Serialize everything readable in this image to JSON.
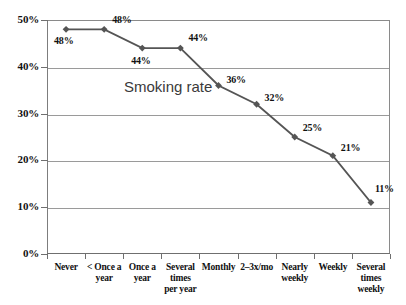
{
  "chart_data": {
    "type": "line",
    "title": "",
    "annotation": "Smoking rate",
    "xlabel": "",
    "ylabel": "",
    "ylim": [
      0,
      50
    ],
    "grid": true,
    "legend_position": "none",
    "series_color": "#555555",
    "marker": "diamond",
    "categories": [
      "Never",
      "< Once a year",
      "Once a year",
      "Several times per year",
      "Monthly",
      "2–3x/mo",
      "Nearly weekly",
      "Weekly",
      "Several times weekly"
    ],
    "category_lines": [
      [
        "Never"
      ],
      [
        "< Once a",
        "year"
      ],
      [
        "Once a",
        "year"
      ],
      [
        "Several",
        "times",
        "per year"
      ],
      [
        "Monthly"
      ],
      [
        "2–3x/mo"
      ],
      [
        "Nearly",
        "weekly"
      ],
      [
        "Weekly"
      ],
      [
        "Several",
        "times",
        "weekly"
      ]
    ],
    "values": [
      48,
      48,
      44,
      44,
      36,
      32,
      25,
      21,
      11
    ],
    "point_labels": [
      "48%",
      "48%",
      "44%",
      "44%",
      "36%",
      "32%",
      "25%",
      "21%",
      "11%"
    ],
    "ytick_labels": [
      "50%",
      "40%",
      "30%",
      "20%",
      "10%",
      "0%"
    ],
    "yticks": [
      50,
      40,
      30,
      20,
      10,
      0
    ]
  }
}
